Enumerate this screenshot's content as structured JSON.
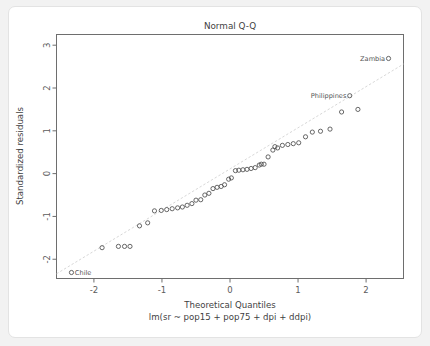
{
  "figure": {
    "title": "Normal Q-Q",
    "xlabel": "Theoretical Quantiles",
    "sublabel": "lm(sr ~ pop15 + pop75 + dpi + ddpi)",
    "ylabel": "Standardized residuals",
    "background_color": "#f2f2f2",
    "card_color": "#ffffff",
    "frame_color": "#6e6e6e",
    "point_color": "#4d4d4d",
    "refline_color": "#d2d2d2"
  },
  "chart_data": {
    "type": "scatter",
    "title": "Normal Q-Q",
    "subtitle": "lm(sr ~ pop15 + pop75 + dpi + ddpi)",
    "xlabel": "Theoretical Quantiles",
    "ylabel": "Standardized residuals",
    "xlim": [
      -2.55,
      2.55
    ],
    "ylim": [
      -2.45,
      3.25
    ],
    "xticks": [
      -2,
      -1,
      0,
      1,
      2
    ],
    "yticks": [
      -2,
      -1,
      0,
      1,
      2,
      3
    ],
    "grid": false,
    "legend": "none",
    "reference_line": {
      "type": "qq-line",
      "style": "dashed",
      "x": [
        -2.55,
        2.55
      ],
      "y": [
        -2.34,
        2.56
      ]
    },
    "marker": "open-circle",
    "n_points": 50,
    "x": [
      -2.33,
      -1.88,
      -1.64,
      -1.47,
      -1.33,
      -1.21,
      -1.11,
      -1.01,
      -0.93,
      -0.85,
      -0.77,
      -0.7,
      -0.63,
      -0.56,
      -0.5,
      -0.43,
      -0.37,
      -0.31,
      -0.25,
      -0.19,
      -0.13,
      -0.08,
      -0.02,
      0.02,
      0.08,
      0.13,
      0.19,
      0.25,
      0.31,
      0.37,
      0.43,
      0.5,
      0.56,
      0.63,
      0.7,
      0.77,
      0.85,
      0.93,
      1.01,
      1.11,
      1.21,
      1.33,
      1.47,
      1.64,
      1.88,
      2.33,
      -1.55,
      0.46,
      0.66,
      1.76
    ],
    "y": [
      -2.31,
      -1.73,
      -1.7,
      -1.7,
      -1.22,
      -1.15,
      -0.87,
      -0.86,
      -0.84,
      -0.82,
      -0.8,
      -0.78,
      -0.74,
      -0.7,
      -0.62,
      -0.61,
      -0.5,
      -0.46,
      -0.35,
      -0.32,
      -0.3,
      -0.26,
      -0.13,
      -0.1,
      0.07,
      0.08,
      0.09,
      0.1,
      0.12,
      0.14,
      0.2,
      0.22,
      0.39,
      0.55,
      0.6,
      0.66,
      0.68,
      0.7,
      0.72,
      0.86,
      0.97,
      0.99,
      1.04,
      1.44,
      1.5,
      2.69,
      -1.7,
      0.22,
      0.63,
      1.82
    ],
    "labeled_points": [
      {
        "label": "Chile",
        "x": -2.33,
        "y": -2.31,
        "label_side": "right"
      },
      {
        "label": "Zambia",
        "x": 2.33,
        "y": 2.69,
        "label_side": "left"
      },
      {
        "label": "Philippines",
        "x": 1.76,
        "y": 1.82,
        "label_side": "left"
      }
    ]
  }
}
